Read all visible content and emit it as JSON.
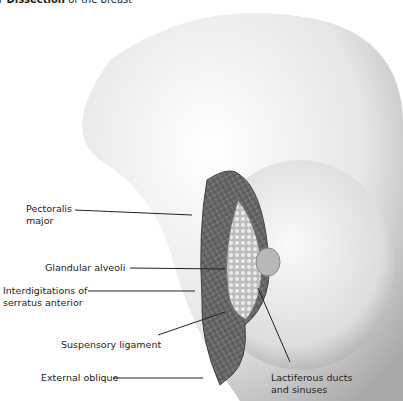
{
  "caption": {
    "bold": "r Dissection",
    "rest": " of the breast"
  },
  "labels": {
    "pectoralis": [
      "Pectoralis",
      "major"
    ],
    "glandular": "Glandular alveoli",
    "serratus": [
      "Interdigitations of",
      "serratus anterior"
    ],
    "suspensory": "Suspensory ligament",
    "oblique": "External oblique",
    "lactiferous": [
      "Lactiferous ducts",
      "and sinuses"
    ]
  },
  "colors": {
    "skin_light": "#f2f2f2",
    "skin_shade": "#bdbdbd",
    "muscle": "#6e6e6e",
    "gland": "#cfcfcf",
    "text": "#222222"
  }
}
